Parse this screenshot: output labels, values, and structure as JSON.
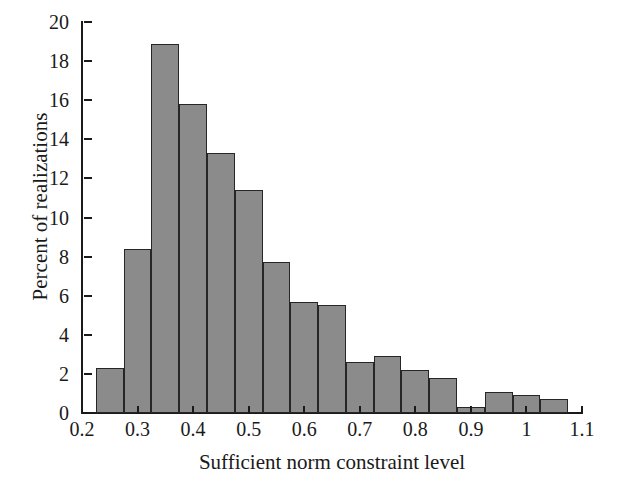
{
  "chart_data": {
    "type": "bar",
    "title": "",
    "subtitle": "",
    "xlabel": "Sufficient norm constraint level",
    "ylabel": "Percent of realizations",
    "xlim": [
      0.2,
      1.1
    ],
    "ylim": [
      0,
      20
    ],
    "grid": false,
    "legend": null,
    "bin_width": 0.05,
    "x_tick_labels": [
      "0.2",
      "0.3",
      "0.4",
      "0.5",
      "0.6",
      "0.7",
      "0.8",
      "0.9",
      "1",
      "1.1"
    ],
    "x_tick_values": [
      0.2,
      0.3,
      0.4,
      0.5,
      0.6,
      0.7,
      0.8,
      0.9,
      1.0,
      1.1
    ],
    "y_tick_labels": [
      "0",
      "2",
      "4",
      "6",
      "8",
      "10",
      "12",
      "14",
      "16",
      "18",
      "20"
    ],
    "y_tick_values": [
      0,
      2,
      4,
      6,
      8,
      10,
      12,
      14,
      16,
      18,
      20
    ],
    "bin_edges": [
      0.225,
      0.275,
      0.325,
      0.375,
      0.425,
      0.475,
      0.525,
      0.575,
      0.625,
      0.675,
      0.725,
      0.775,
      0.825,
      0.875,
      0.925,
      0.975,
      1.025,
      1.075
    ],
    "categories": [
      "0.225-0.275",
      "0.275-0.325",
      "0.325-0.375",
      "0.375-0.425",
      "0.425-0.475",
      "0.475-0.525",
      "0.525-0.575",
      "0.575-0.625",
      "0.625-0.675",
      "0.675-0.725",
      "0.725-0.775",
      "0.775-0.825",
      "0.825-0.875",
      "0.875-0.925",
      "0.925-0.975",
      "0.975-1.025",
      "1.025-1.075"
    ],
    "values": [
      2.3,
      8.4,
      18.9,
      15.8,
      13.3,
      11.4,
      7.7,
      5.7,
      5.5,
      2.6,
      2.9,
      2.2,
      1.8,
      0.3,
      1.1,
      0.9,
      0.7
    ],
    "bar_fill_color": "#8b8b8b",
    "bar_edge_color": "#262626",
    "axis_color": "#1a1a1a",
    "background_color": "#ffffff"
  }
}
